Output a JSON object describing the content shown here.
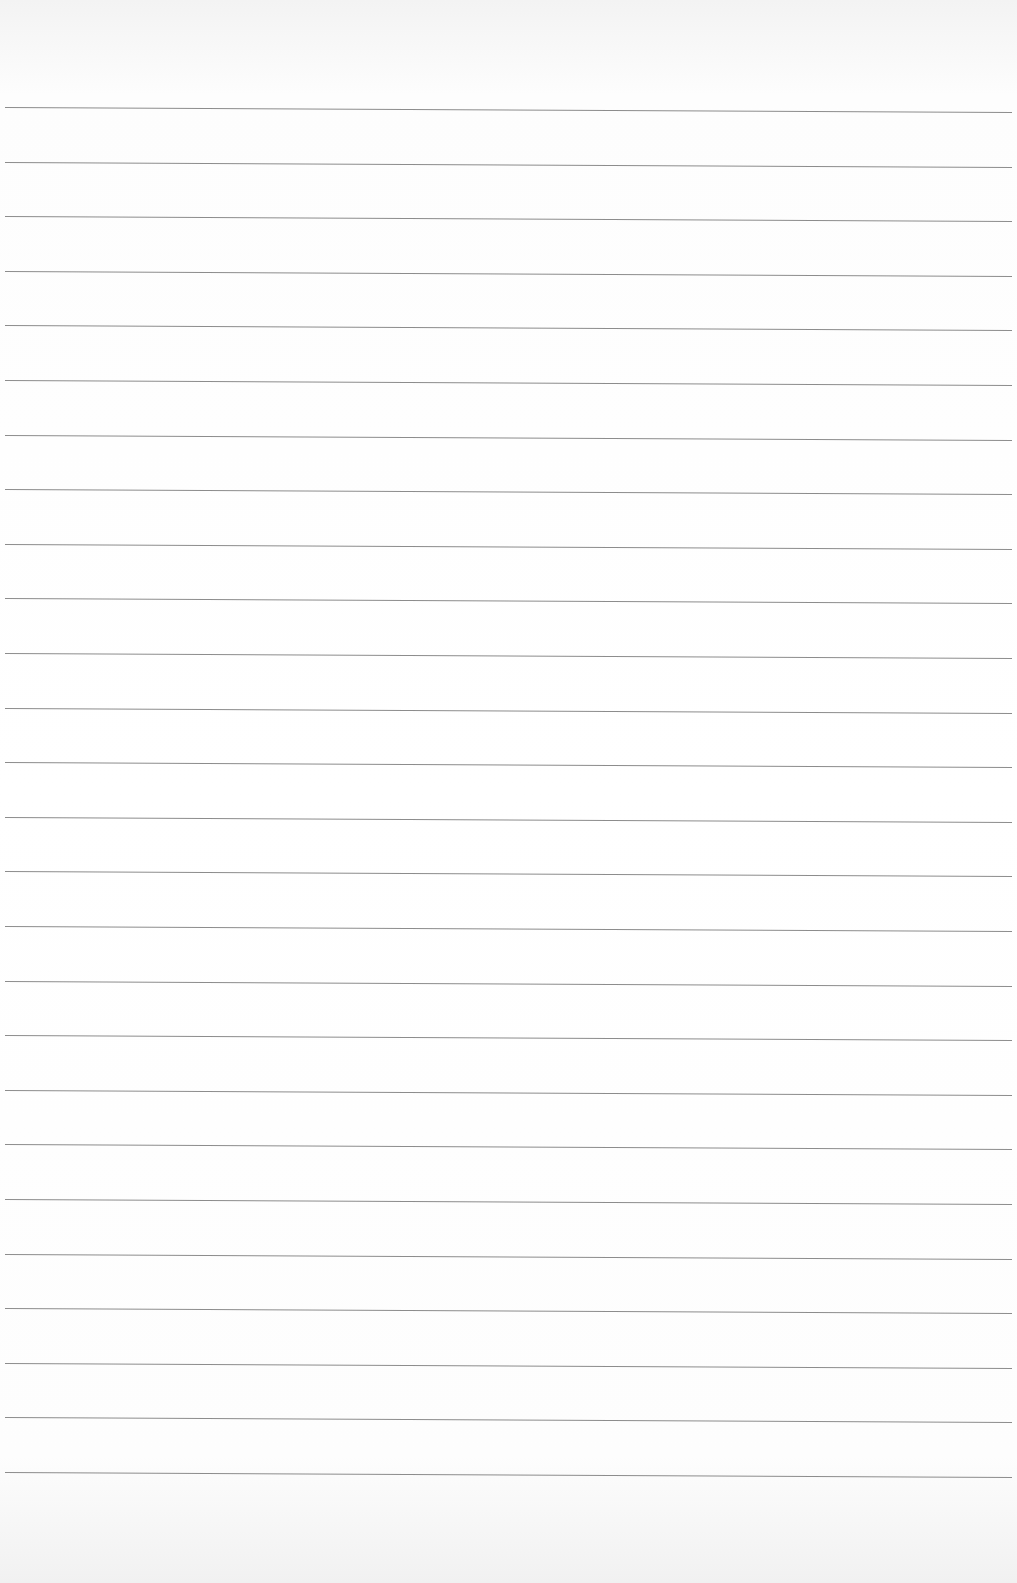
{
  "paper": {
    "type": "lined-paper",
    "line_count": 26,
    "first_line_y": 107,
    "line_spacing": 54.6,
    "line_color": "#8c8c8c",
    "background_color": "#ffffff"
  }
}
